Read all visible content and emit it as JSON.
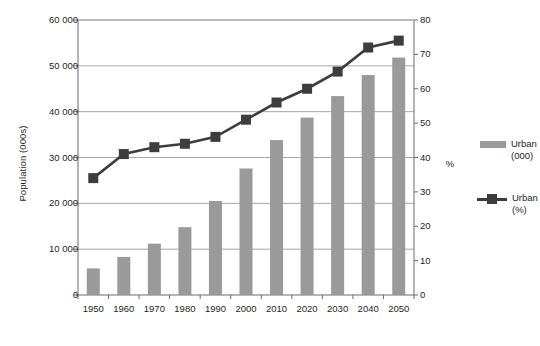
{
  "chart_data": {
    "type": "bar",
    "title": "",
    "xlabel": "",
    "ylabel": "Population (000s)",
    "y2label": "%",
    "categories": [
      "1950",
      "1960",
      "1970",
      "1980",
      "1990",
      "2000",
      "2010",
      "2020",
      "2030",
      "2040",
      "2050"
    ],
    "grid": true,
    "legend_position": "right",
    "ylim": [
      0,
      60000
    ],
    "yticks": [
      "0",
      "10 000",
      "20 000",
      "30 000",
      "40 000",
      "50 000",
      "60 000"
    ],
    "ytick_values": [
      0,
      10000,
      20000,
      30000,
      40000,
      50000,
      60000
    ],
    "y2lim": [
      0,
      80
    ],
    "y2ticks": [
      "0",
      "10",
      "20",
      "30",
      "40",
      "50",
      "60",
      "70",
      "80"
    ],
    "y2tick_values": [
      0,
      10,
      20,
      30,
      40,
      50,
      60,
      70,
      80
    ],
    "series": [
      {
        "name": "Urban (000)",
        "type": "bar",
        "axis": "left",
        "color": "#9a9a9a",
        "values": [
          5800,
          8300,
          11200,
          14800,
          20500,
          27600,
          33800,
          38700,
          43400,
          48000,
          51800
        ]
      },
      {
        "name": "Urban (%)",
        "type": "line",
        "axis": "right",
        "color": "#3d3d3d",
        "values": [
          34,
          41,
          43,
          44,
          46,
          51,
          56,
          60,
          65,
          72,
          74
        ]
      }
    ]
  },
  "legend": {
    "items": [
      {
        "label_line1": "Urban",
        "label_line2": "(000)",
        "marker": "bar"
      },
      {
        "label_line1": "Urban",
        "label_line2": "(%)",
        "marker": "line"
      }
    ]
  }
}
